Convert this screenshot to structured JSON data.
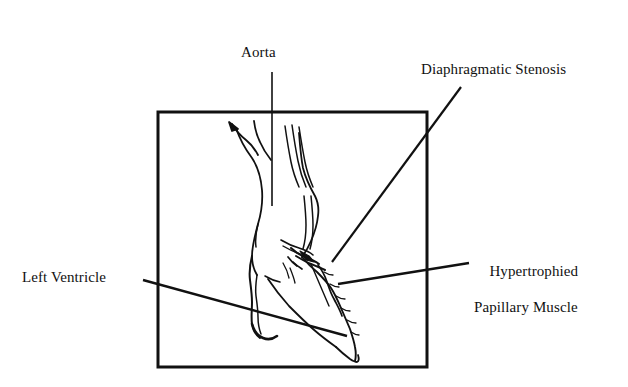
{
  "figure": {
    "type": "anatomical-line-drawing",
    "background_color": "#ffffff",
    "ink_color": "#111111",
    "frame": {
      "name": "diagram-frame",
      "x": 158,
      "y": 112,
      "width": 269,
      "height": 255,
      "stroke_width": 3,
      "stroke_color": "#111111",
      "fill": "none"
    }
  },
  "labels": {
    "aorta": {
      "text": "Aorta",
      "x": 241,
      "y": 43
    },
    "diaphragmatic_stenosis": {
      "text": "Diaphragmatic Stenosis",
      "x": 421,
      "y": 60
    },
    "left_ventricle": {
      "text": "Left Ventricle",
      "x": 22,
      "y": 268
    },
    "hypertrophied_papillary_muscle": {
      "line1": "Hypertrophied",
      "line2": "Papillary Muscle",
      "x": 474,
      "y": 244
    }
  },
  "leader_lines": [
    {
      "name": "leader-aorta",
      "from": [
        272,
        72
      ],
      "to": [
        272,
        206
      ],
      "stroke_width": 1.6
    },
    {
      "name": "leader-diaphragmatic-stenosis",
      "from": [
        461,
        87
      ],
      "to": [
        332,
        262
      ],
      "stroke_width": 2.2
    },
    {
      "name": "leader-left-ventricle",
      "from": [
        143,
        280
      ],
      "to": [
        347,
        336
      ],
      "stroke_width": 2.4
    },
    {
      "name": "leader-hypertrophied-papillary-muscle",
      "from": [
        469,
        263
      ],
      "to": [
        338,
        284
      ],
      "stroke_width": 2.4
    }
  ],
  "anatomy_paths": {
    "aorta_left_wall": "M236,128 C240,140 246,150 252,158 C258,167 261,178 262,190 C263,203 261,214 258,224 C255,235 252,246 252,256 C252,264 254,270 257,275",
    "aorta_right_wall": "M299,133 C300,146 301,158 303,168 C306,180 311,189 315,196 C318,202 319,209 318,216 C317,226 314,234 311,241 C308,248 305,253 302,257",
    "brachiocephalic_branch": "M232,124 C236,131 241,136 246,140 C251,144 255,149 258,155",
    "brachiocephalic_tip": "M229,122 L238,129 L232,131 Z",
    "carotid_branch": "M254,121 C255,129 257,136 260,142 C263,149 267,155 271,160",
    "subclavian_branch_a": "M285,126 C287,140 289,152 291,162 C293,172 296,180 299,187",
    "subclavian_branch_b": "M292,125 C294,139 296,151 298,161 C300,171 303,180 306,187",
    "subclavian_branch_c": "M299,127 C301,140 303,152 305,162 C307,172 310,180 313,187",
    "sinus_left": "M258,224 C256,232 255,240 256,247",
    "valve_leaflet_left": "M281,240 C286,243 292,246 299,248 C305,250 310,252 313,255",
    "valve_leaflet_right": "M283,246 C288,249 294,252 300,254",
    "stenosis_ridge_a": "M291,248 C295,252 300,255 305,257 C310,259 315,261 319,264",
    "stenosis_ridge_b": "M296,256 C301,259 306,262 311,264 C316,266 321,268 325,270",
    "stenosis_membrane": "M300,251 L309,256 L314,262 L306,260 Z",
    "stenosis_spur_a": "M288,257 C291,261 294,264 297,266",
    "stenosis_spur_b": "M293,262 C296,265 299,267 302,269",
    "septum_outer": "M252,256 C250,264 249,272 250,280 C251,288 252,295 252,302 C252,310 251,317 252,324 C253,330 256,335 260,338",
    "septum_inner": "M257,275 C256,282 255,289 256,296 C257,303 258,310 258,317 C258,323 259,329 261,334",
    "septum_apex_hook": "M252,324 C254,331 258,336 263,338 C268,340 273,339 277,336",
    "lv_cavity_wall": "M268,279 C274,288 281,297 289,306 C297,314 305,322 313,329 C321,336 329,342 336,347",
    "lv_free_wall_outer": "M302,257 C307,263 312,268 317,272 C322,277 327,282 331,288 C335,294 338,301 341,308 C344,315 347,322 350,329 C352,335 354,341 355,347 C356,352 356,357 355,361",
    "lv_apex": "M336,347 C341,352 346,356 350,359 C353,361 355,362 357,362 C359,361 359,358 358,355",
    "papillary_muscle_outline": "M318,265 C322,270 325,276 327,282 C329,288 331,294 334,299 C337,305 340,310 342,316",
    "papillary_notch_a": "M324,272 C327,274 330,275 333,275",
    "papillary_notch_b": "M330,284 C333,286 336,287 339,287",
    "papillary_notch_c": "M336,296 C339,298 342,299 345,299",
    "papillary_notch_d": "M341,308 C344,310 347,311 350,311",
    "papillary_notch_e": "M347,320 C350,322 353,323 356,323",
    "papillary_notch_f": "M351,332 C354,334 357,335 359,335",
    "chordae_a": "M283,263 C286,268 288,273 289,278",
    "chordae_b": "M290,268 C292,273 294,278 295,283",
    "mitral_leaflet": "M265,276 C270,279 275,281 280,282",
    "outflow_inner_a": "M304,196 C305,206 306,216 306,225 C306,234 305,242 303,249",
    "outflow_inner_b": "M311,196 C312,206 313,216 313,225 C313,234 312,242 310,249",
    "lv_lateral_inner": "M311,264 C314,271 317,278 320,285 C323,292 326,299 329,306"
  }
}
